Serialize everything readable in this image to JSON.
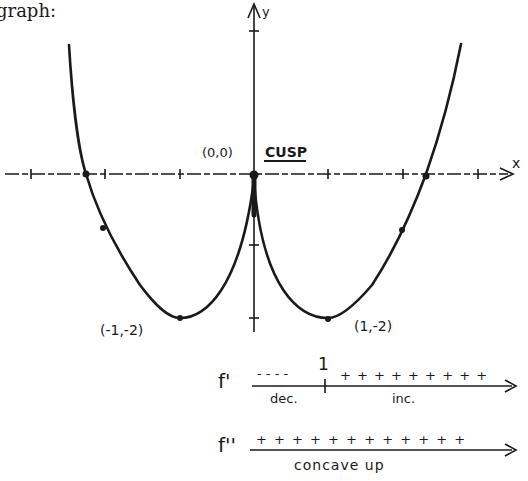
{
  "heading": "graph:",
  "graph": {
    "axis_x_label": "x",
    "axis_y_label": "y",
    "cusp_point_label": "(0,0)",
    "cusp_label": "CUSP",
    "min_left_label": "(-1,-2)",
    "min_right_label": "(1,-2)"
  },
  "sign_charts": {
    "first_derivative": {
      "label": "f'",
      "critical_value": "1",
      "left_signs": "- - - -",
      "right_signs": "+ + + + + + + + +",
      "left_note": "dec.",
      "right_note": "inc."
    },
    "second_derivative": {
      "label": "f''",
      "signs": "+ + + + + + + + + + + +",
      "note": "concave up"
    }
  },
  "colors": {
    "ink": "#1a1a1a",
    "background": "#ffffff"
  }
}
